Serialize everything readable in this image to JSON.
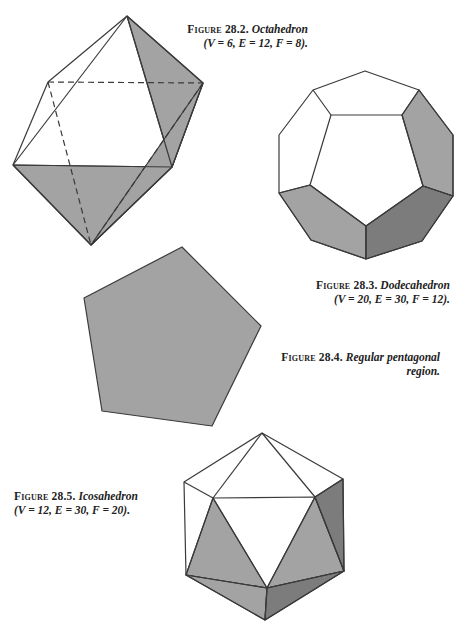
{
  "figures": [
    {
      "id": "28.2",
      "label": "Figure 28.2.",
      "title": "Octahedron",
      "params": "(V = 6, E = 12, F = 8)."
    },
    {
      "id": "28.3",
      "label": "Figure 28.3.",
      "title": "Dodecahedron",
      "params": "(V = 20, E = 30, F = 12)."
    },
    {
      "id": "28.4",
      "label": "Figure 28.4.",
      "title": "Regular pentagonal",
      "title_line2": "region."
    },
    {
      "id": "28.5",
      "label": "Figure 28.5.",
      "title": "Icosahedron",
      "params": "(V = 12, E = 30, F = 20)."
    }
  ],
  "colors": {
    "face_light": "#a3a3a3",
    "face_dark": "#7c7c7c",
    "edge": "#3a3a3a",
    "background": "#ffffff"
  }
}
